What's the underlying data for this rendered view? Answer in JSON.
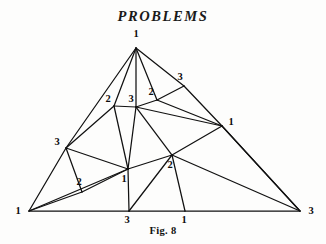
{
  "page": {
    "title": "PROBLEMS",
    "caption": "Fig. 8",
    "background_color": "#fdfdfc",
    "ink_color": "#111111"
  },
  "figure": {
    "name": "Fig. 8",
    "label_set": [
      "1",
      "2",
      "3"
    ],
    "corner_labels": {
      "apex": "1",
      "bottom_left": "1",
      "bottom_right": "3"
    }
  },
  "chart_data": {
    "type": "diagram",
    "title": "Fig. 8",
    "subtitle": "PROBLEMS",
    "xlabel": "",
    "ylabel": "",
    "grid": false,
    "legend": "none",
    "xlim": [
      0,
      326
    ],
    "ylim": [
      0,
      244
    ],
    "vertices": [
      {
        "id": "apex",
        "label": "1",
        "x": 136,
        "y": 48,
        "lx": 136,
        "ly": 35
      },
      {
        "id": "bl",
        "label": "1",
        "x": 29,
        "y": 211,
        "lx": 18,
        "ly": 212
      },
      {
        "id": "br",
        "label": "3",
        "x": 300,
        "y": 211,
        "lx": 311,
        "ly": 212
      },
      {
        "id": "l3",
        "label": "3",
        "x": 66,
        "y": 148,
        "lx": 57,
        "ly": 143
      },
      {
        "id": "l2",
        "label": "2",
        "x": 82,
        "y": 192,
        "lx": 79,
        "ly": 183
      },
      {
        "id": "c2",
        "label": "2",
        "x": 114,
        "y": 106,
        "lx": 108,
        "ly": 100
      },
      {
        "id": "c3",
        "label": "3",
        "x": 136,
        "y": 107,
        "lx": 131,
        "ly": 100
      },
      {
        "id": "u2",
        "label": "2",
        "x": 157,
        "y": 100,
        "lx": 151,
        "ly": 93
      },
      {
        "id": "u3",
        "label": "3",
        "x": 184,
        "y": 86,
        "lx": 180,
        "ly": 78
      },
      {
        "id": "r1",
        "label": "1",
        "x": 222,
        "y": 126,
        "lx": 231,
        "ly": 123
      },
      {
        "id": "c1",
        "label": "1",
        "x": 128,
        "y": 169,
        "lx": 124,
        "ly": 180
      },
      {
        "id": "m2",
        "label": "2",
        "x": 172,
        "y": 155,
        "lx": 170,
        "ly": 166
      },
      {
        "id": "b3",
        "label": "3",
        "x": 129,
        "y": 211,
        "lx": 127,
        "ly": 221
      },
      {
        "id": "b1",
        "label": "1",
        "x": 185,
        "y": 211,
        "lx": 184,
        "ly": 221
      }
    ],
    "edges": [
      [
        "apex",
        "l3"
      ],
      [
        "l3",
        "bl"
      ],
      [
        "bl",
        "b3"
      ],
      [
        "b3",
        "b1"
      ],
      [
        "b1",
        "br"
      ],
      [
        "apex",
        "u3"
      ],
      [
        "u3",
        "r1"
      ],
      [
        "r1",
        "br"
      ],
      [
        "apex",
        "c2"
      ],
      [
        "apex",
        "c3"
      ],
      [
        "apex",
        "u2"
      ],
      [
        "c2",
        "c3"
      ],
      [
        "c2",
        "l3"
      ],
      [
        "c2",
        "c1"
      ],
      [
        "c3",
        "u2"
      ],
      [
        "c3",
        "r1"
      ],
      [
        "c3",
        "m2"
      ],
      [
        "c3",
        "c1"
      ],
      [
        "u2",
        "u3"
      ],
      [
        "u2",
        "r1"
      ],
      [
        "l3",
        "l2"
      ],
      [
        "l3",
        "c1"
      ],
      [
        "l2",
        "bl"
      ],
      [
        "l2",
        "c1"
      ],
      [
        "bl",
        "c1"
      ],
      [
        "c1",
        "b3"
      ],
      [
        "c1",
        "m2"
      ],
      [
        "m2",
        "r1"
      ],
      [
        "m2",
        "br"
      ],
      [
        "m2",
        "b3"
      ],
      [
        "m2",
        "b1"
      ],
      [
        "r1",
        "br"
      ]
    ]
  }
}
